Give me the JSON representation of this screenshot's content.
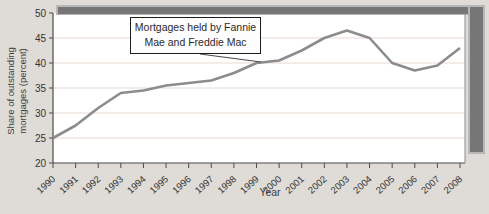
{
  "figure": {
    "background": "#dfdcd7",
    "plot_background": "#ffffff",
    "grid_color": "#e9d9d2",
    "line_color": "#8c8c8c",
    "shadow_color": "#767676",
    "shadow_edge_color": "#b7b7b7",
    "axis_color": "#4a4a4a",
    "tick_label_color": "#333333"
  },
  "annotation": {
    "text": "Mortgages held by Fannie\nMae and Freddie Mac"
  },
  "axes": {
    "y_title": "Share of outstanding\nmortgages (percent)",
    "x_title": "Year"
  },
  "chart_data": {
    "type": "line",
    "title": "",
    "x": [
      1990,
      1991,
      1992,
      1993,
      1994,
      1995,
      1996,
      1997,
      1998,
      1999,
      2000,
      2001,
      2002,
      2003,
      2004,
      2005,
      2006,
      2007,
      2008
    ],
    "series": [
      {
        "name": "Mortgages held by Fannie Mae and Freddie Mac",
        "values": [
          25,
          27.5,
          31,
          34,
          34.5,
          35.5,
          36,
          36.5,
          38,
          40,
          40.5,
          42.5,
          45,
          46.5,
          45,
          40,
          38.5,
          39.5,
          43
        ]
      }
    ],
    "ylim": [
      20,
      50
    ],
    "yticks": [
      20,
      25,
      30,
      35,
      40,
      45,
      50
    ],
    "xlabel": "Year",
    "ylabel": "Share of outstanding mortgages (percent)",
    "grid": true,
    "legend": "none",
    "annotation": "Mortgages held by Fannie Mae and Freddie Mac"
  }
}
